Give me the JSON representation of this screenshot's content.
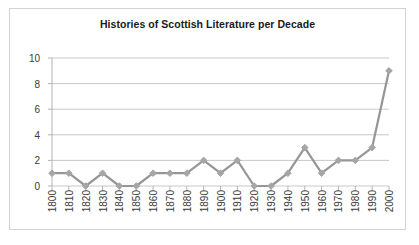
{
  "chart_data": {
    "type": "line",
    "title": "Histories of Scottish Literature per Decade",
    "xlabel": "",
    "ylabel": "",
    "categories": [
      "1800",
      "1810",
      "1820",
      "1830",
      "1840",
      "1850",
      "1860",
      "1870",
      "1880",
      "1890",
      "1900",
      "1910",
      "1920",
      "1930",
      "1940",
      "1950",
      "1960",
      "1970",
      "1980",
      "1990",
      "2000"
    ],
    "values": [
      1,
      1,
      0,
      1,
      0,
      0,
      1,
      1,
      1,
      2,
      1,
      2,
      0,
      0,
      1,
      3,
      1,
      2,
      2,
      3,
      9
    ],
    "series": [
      {
        "name": "Histories per decade",
        "values": [
          1,
          1,
          0,
          1,
          0,
          0,
          1,
          1,
          1,
          2,
          1,
          2,
          0,
          0,
          1,
          3,
          1,
          2,
          2,
          3,
          9
        ]
      }
    ],
    "ylim": [
      0,
      10
    ],
    "ytick_labels": [
      "0",
      "2",
      "4",
      "6",
      "8",
      "10"
    ],
    "ytick_values": [
      0,
      2,
      4,
      6,
      8,
      10
    ],
    "grid": "horizontal",
    "legend": "none",
    "line_color": "#969696",
    "marker": "diamond",
    "marker_color": "#a6a6a6",
    "axis_color": "#b3b3b3",
    "grid_color": "#c8c8c8",
    "border_color": "#d2d2d2",
    "text_color": "#3a3a3a",
    "title_color": "#1a1a1a",
    "background": "#ffffff"
  }
}
